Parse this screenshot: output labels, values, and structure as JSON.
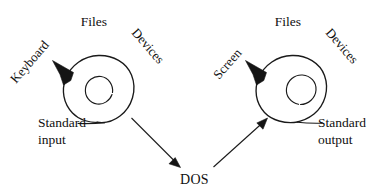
{
  "figure": {
    "title": "DOS standard input and standard output redirection diagram",
    "background_color": "#ffffff",
    "ink_color": "#101010",
    "width": 378,
    "height": 194
  },
  "center_node": {
    "label": "DOS"
  },
  "input_group": {
    "name": "standard-input-group",
    "top_label": "Files",
    "left_label": "Keyboard",
    "right_label": "Devices",
    "bottom_label_line1": "Standard",
    "bottom_label_line2": "input",
    "arrow_direction": "to-dos"
  },
  "output_group": {
    "name": "standard-output-group",
    "top_label": "Files",
    "left_label": "Screen",
    "right_label": "Devices",
    "bottom_label_line1": "Standard",
    "bottom_label_line2": "output",
    "arrow_direction": "from-dos"
  },
  "icons": {
    "spiral_left": "spiral-icon",
    "spiral_right": "spiral-icon",
    "arrowhead_left": "arrowhead-icon",
    "arrowhead_right": "arrowhead-icon",
    "flow_arrow_input": "arrow-down-right-icon",
    "flow_arrow_output": "arrow-up-right-icon"
  }
}
